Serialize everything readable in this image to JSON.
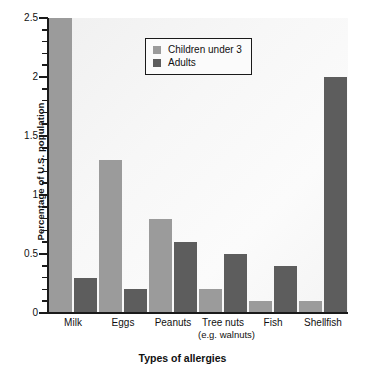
{
  "chart_data": {
    "type": "bar",
    "title": "",
    "xlabel": "Types of allergies",
    "ylabel": "Percentage of U.S. population",
    "categories": [
      "Milk",
      "Eggs",
      "Peanuts",
      "Tree nuts",
      "Fish",
      "Shellfish"
    ],
    "category_sublabels": [
      "",
      "",
      "",
      "(e.g. walnuts)",
      "",
      ""
    ],
    "series": [
      {
        "name": "Children under 3",
        "color": "#9b9b9b",
        "values": [
          2.5,
          1.3,
          0.8,
          0.2,
          0.1,
          0.1
        ]
      },
      {
        "name": "Adults",
        "color": "#5d5d5d",
        "values": [
          0.3,
          0.2,
          0.6,
          0.5,
          0.4,
          2.0
        ]
      }
    ],
    "ylim": [
      0,
      2.5
    ],
    "ytick_labels": [
      "0",
      "0.5",
      "1",
      "1.5",
      "2",
      "2.5"
    ],
    "ytick_values": [
      0,
      0.5,
      1,
      1.5,
      2,
      2.5
    ],
    "yminor_step": 0.1,
    "grid": false,
    "legend_position": "top-center"
  },
  "legend": {
    "entries": [
      {
        "label": "Children under 3",
        "swatch": "light"
      },
      {
        "label": "Adults",
        "swatch": "dark"
      }
    ]
  },
  "axes": {
    "y_title": "Percentage of U.S. population",
    "x_title": "Types of allergies"
  },
  "colors": {
    "series_children": "#9b9b9b",
    "series_adults": "#5d5d5d",
    "axis": "#1a1a1a",
    "plot_background": "#f6f6f6"
  }
}
